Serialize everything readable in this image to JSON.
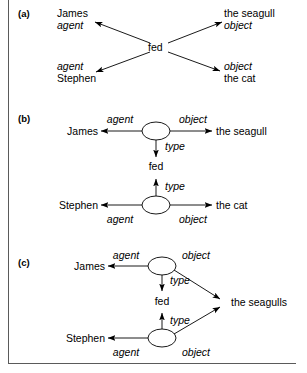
{
  "figure": {
    "panels": [
      {
        "id": "a",
        "tag": "(a)",
        "center_node": "fed",
        "nodes": [
          {
            "key": "james",
            "text": "James"
          },
          {
            "key": "seagull",
            "text": "the seagull"
          },
          {
            "key": "stephen",
            "text": "Stephen"
          },
          {
            "key": "cat",
            "text": "the cat"
          }
        ],
        "edges": [
          {
            "from": "fed",
            "to": "james",
            "label": "agent"
          },
          {
            "from": "fed",
            "to": "seagull",
            "label": "object"
          },
          {
            "from": "fed",
            "to": "stephen",
            "label": "agent"
          },
          {
            "from": "fed",
            "to": "cat",
            "label": "object"
          }
        ]
      },
      {
        "id": "b",
        "tag": "(b)",
        "center_node": "fed",
        "nodes": [
          {
            "key": "james",
            "text": "James"
          },
          {
            "key": "seagull",
            "text": "the seagull"
          },
          {
            "key": "stephen",
            "text": "Stephen"
          },
          {
            "key": "cat",
            "text": "the cat"
          }
        ],
        "relation_nodes": [
          {
            "key": "rel1",
            "shape": "ellipse"
          },
          {
            "key": "rel2",
            "shape": "ellipse"
          }
        ],
        "edges": [
          {
            "from": "rel1",
            "to": "james",
            "label": "agent"
          },
          {
            "from": "rel1",
            "to": "seagull",
            "label": "object"
          },
          {
            "from": "rel1",
            "to": "fed",
            "label": "type"
          },
          {
            "from": "rel2",
            "to": "stephen",
            "label": "agent"
          },
          {
            "from": "rel2",
            "to": "cat",
            "label": "object"
          },
          {
            "from": "rel2",
            "to": "fed",
            "label": "type"
          }
        ]
      },
      {
        "id": "c",
        "tag": "(c)",
        "center_node": "fed",
        "nodes": [
          {
            "key": "james",
            "text": "James"
          },
          {
            "key": "seagulls",
            "text": "the seagulls"
          },
          {
            "key": "stephen",
            "text": "Stephen"
          }
        ],
        "relation_nodes": [
          {
            "key": "rel1",
            "shape": "ellipse"
          },
          {
            "key": "rel2",
            "shape": "ellipse"
          }
        ],
        "edges": [
          {
            "from": "rel1",
            "to": "james",
            "label": "agent"
          },
          {
            "from": "rel1",
            "to": "seagulls",
            "label": "object"
          },
          {
            "from": "rel1",
            "to": "fed",
            "label": "type"
          },
          {
            "from": "rel2",
            "to": "stephen",
            "label": "agent"
          },
          {
            "from": "rel2",
            "to": "seagulls",
            "label": "object"
          },
          {
            "from": "rel2",
            "to": "fed",
            "label": "type"
          }
        ]
      }
    ],
    "colors": {
      "line": "#000000",
      "text": "#000000",
      "border": "#5a5a5a",
      "background": "#ffffff"
    }
  }
}
